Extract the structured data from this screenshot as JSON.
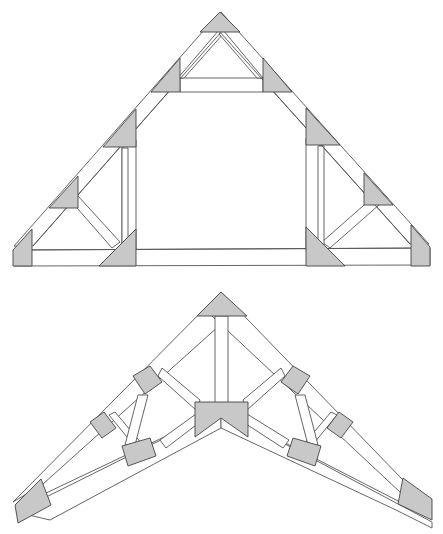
{
  "figure": {
    "trusses": [
      {
        "name": "attic-truss",
        "position": "top",
        "gusset_plates": 11
      },
      {
        "name": "scissor-truss",
        "position": "bottom",
        "gusset_plates": 9
      }
    ],
    "colors": {
      "background": "#ffffff",
      "member_fill": "#ffffff",
      "member_stroke": "#555555",
      "plate_fill": "#c8c8c8",
      "plate_dots": "#555555"
    }
  }
}
